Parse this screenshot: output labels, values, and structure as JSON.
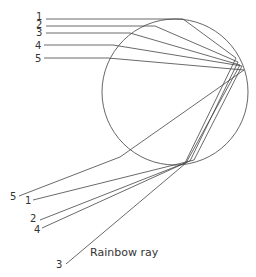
{
  "diagram": {
    "title": "Rainbow ray",
    "droplet": {
      "cx": 175,
      "cy": 92,
      "r": 73
    },
    "incoming_labels": [
      {
        "id": "1",
        "x": 10,
        "y": 20
      },
      {
        "id": "2",
        "x": 10,
        "y": 28
      },
      {
        "id": "3",
        "x": 10,
        "y": 36
      },
      {
        "id": "4",
        "x": 10,
        "y": 48
      },
      {
        "id": "5",
        "x": 10,
        "y": 61
      }
    ],
    "outgoing_labels": [
      {
        "id": "5",
        "x": 6,
        "y": 197
      },
      {
        "id": "1",
        "x": 28,
        "y": 203
      },
      {
        "id": "2",
        "x": 30,
        "y": 221
      },
      {
        "id": "4",
        "x": 36,
        "y": 232
      },
      {
        "id": "3",
        "x": 57,
        "y": 267
      }
    ],
    "caption": "Rainbow ray"
  }
}
